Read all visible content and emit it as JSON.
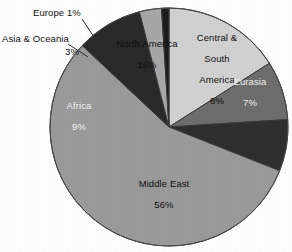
{
  "chart_data": {
    "type": "pie",
    "title": "",
    "subtitle": "",
    "xlabel": "",
    "ylabel": "",
    "legend_position": "none",
    "grid": false,
    "units": "percent",
    "total": 100,
    "categories": [
      "North America",
      "Central & South America",
      "Eurasia",
      "Middle East",
      "Africa",
      "Asia & Oceania",
      "Europe"
    ],
    "values": [
      16,
      8,
      7,
      56,
      9,
      3,
      1
    ],
    "slices": [
      {
        "label": "North America",
        "value": 16,
        "value_text": "16%",
        "label_text": "North America\n16%",
        "color": "#d2d2d2",
        "text_color": "#101010",
        "label_placement": "inside",
        "start_angle": 0,
        "end_angle": 57.6
      },
      {
        "label": "Central & South America",
        "value": 8,
        "value_text": "8%",
        "label_text": "Central &\nSouth\nAmerica\n8%",
        "color": "#6e6e6e",
        "text_color": "#101010",
        "label_placement": "inside",
        "start_angle": 57.6,
        "end_angle": 86.4
      },
      {
        "label": "Eurasia",
        "value": 7,
        "value_text": "7%",
        "label_text": "Eurasia\n7%",
        "color": "#2f2f2f",
        "text_color": "#f2f2f2",
        "label_placement": "inside",
        "start_angle": 86.4,
        "end_angle": 111.6
      },
      {
        "label": "Middle East",
        "value": 56,
        "value_text": "56%",
        "label_text": "Middle East\n56%",
        "color": "#9b9b9b",
        "text_color": "#101010",
        "label_placement": "inside",
        "start_angle": 111.6,
        "end_angle": 313.2
      },
      {
        "label": "Africa",
        "value": 9,
        "value_text": "9%",
        "label_text": "Africa\n9%",
        "color": "#2a2a2a",
        "text_color": "#f2f2f2",
        "label_placement": "inside",
        "start_angle": 313.2,
        "end_angle": 345.6
      },
      {
        "label": "Asia & Oceania",
        "value": 3,
        "value_text": "3%",
        "label_text": "3%",
        "color": "#a8a8a8",
        "text_color": "#101010",
        "label_placement": "inside-value-callout-label",
        "callout_text": "Asia & Oceania",
        "start_angle": 345.6,
        "end_angle": 356.4
      },
      {
        "label": "Europe",
        "value": 1,
        "value_text": "1%",
        "label_text": "",
        "color": "#1c1c1c",
        "text_color": "#101010",
        "label_placement": "callout",
        "callout_text": "Europe 1%",
        "start_angle": 356.4,
        "end_angle": 360
      }
    ]
  },
  "labels": {
    "north_america": "North America",
    "north_america_pct": "16%",
    "central_south_america_l1": "Central &",
    "central_south_america_l2": "South",
    "central_south_america_l3": "America",
    "central_south_america_pct": "8%",
    "eurasia": "Eurasia",
    "eurasia_pct": "7%",
    "middle_east": "Middle East",
    "middle_east_pct": "56%",
    "africa": "Africa",
    "africa_pct": "9%",
    "asia_oceania_callout": "Asia & Oceania",
    "asia_oceania_pct": "3%",
    "europe_callout": "Europe 1%"
  },
  "colors": {
    "background": "#ffffff",
    "outline": "#3a3a3a",
    "leader_line": "#2b2b2b",
    "north_america": "#d2d2d2",
    "central_south_america": "#6e6e6e",
    "eurasia": "#2f2f2f",
    "middle_east": "#9b9b9b",
    "africa": "#2a2a2a",
    "asia_oceania": "#a8a8a8",
    "europe": "#1c1c1c"
  }
}
